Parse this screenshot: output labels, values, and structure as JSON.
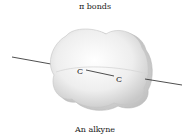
{
  "diagram": {
    "title": "π bonds",
    "caption": "An alkyne",
    "atoms": [
      {
        "label": "C",
        "x": 80,
        "y": 71
      },
      {
        "label": "C",
        "x": 119,
        "y": 79
      }
    ],
    "colors": {
      "cloud_fill": "#e8e8e8",
      "cloud_edge": "#c4c4c4",
      "line": "#222222",
      "text": "#222222"
    }
  }
}
